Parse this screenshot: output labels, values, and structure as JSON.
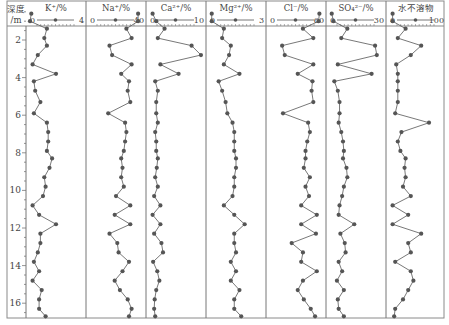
{
  "chart_data": {
    "type": "line",
    "title": "",
    "ylabel": "深度/m",
    "ylabel_lines": [
      "深度",
      "/m"
    ],
    "y_axis": {
      "range": [
        0,
        16.8
      ],
      "ticks": [
        2,
        4,
        6,
        8,
        10,
        12,
        14,
        16
      ],
      "tick_labels": [
        "2",
        "4",
        "6",
        "8",
        "10",
        "12",
        "14",
        "16"
      ],
      "inverted": true
    },
    "depths": [
      0.6,
      1.0,
      1.4,
      1.9,
      2.3,
      2.8,
      3.3,
      3.8,
      4.2,
      4.7,
      5.3,
      5.9,
      6.4,
      6.9,
      7.4,
      7.9,
      8.3,
      8.8,
      9.3,
      9.8,
      10.3,
      10.8,
      11.3,
      11.8,
      12.3,
      12.8,
      13.3,
      13.8,
      14.3,
      14.8,
      15.3,
      15.8,
      16.3,
      16.7
    ],
    "series": [
      {
        "name": "K⁺/%",
        "label_html": "K<tspan baseline-shift='super' font-size='6'>+</tspan>/%",
        "xlim": [
          0,
          4
        ],
        "tick_labels": [
          "0",
          "4"
        ],
        "values": [
          0.1,
          0.0,
          1.3,
          1.1,
          1.3,
          0.6,
          0.2,
          2.0,
          0.3,
          0.4,
          0.8,
          0.3,
          1.3,
          1.4,
          1.4,
          1.3,
          1.7,
          1.5,
          1.1,
          1.2,
          1.0,
          0.2,
          0.7,
          2.0,
          0.8,
          0.8,
          0.6,
          0.3,
          0.7,
          0.2,
          0.9,
          0.7,
          0.7,
          1.2
        ]
      },
      {
        "name": "Na⁺/%",
        "xlim": [
          0,
          40
        ],
        "tick_labels": [
          "0",
          "40"
        ],
        "values": [
          37,
          37,
          28,
          32,
          15,
          17,
          32,
          24,
          30,
          29,
          31,
          14,
          27,
          28,
          27,
          26,
          24,
          25,
          24,
          26,
          20,
          31,
          19,
          31,
          15,
          21,
          22,
          30,
          25,
          19,
          23,
          29,
          32,
          30
        ]
      },
      {
        "name": "Ca²⁺/%",
        "xlim": [
          0,
          10
        ],
        "tick_labels": [
          "0",
          "10"
        ],
        "values": [
          0.5,
          1.2,
          2.8,
          1.5,
          8.0,
          9.8,
          2.0,
          5.5,
          1.0,
          1.5,
          1.2,
          1.2,
          1.5,
          1.0,
          1.2,
          1.2,
          1.5,
          1.3,
          1.0,
          1.5,
          0.8,
          2.0,
          0.5,
          2.0,
          0.8,
          2.2,
          2.5,
          0.6,
          1.4,
          1.8,
          1.2,
          0.9,
          0.8,
          1.0
        ]
      },
      {
        "name": "Mg²⁺/%",
        "xlim": [
          0,
          3
        ],
        "tick_labels": [
          "0",
          "3"
        ],
        "values": [
          0.1,
          0.1,
          0.8,
          0.7,
          1.2,
          1.1,
          0.8,
          1.7,
          0.5,
          0.7,
          0.9,
          1.0,
          1.3,
          1.4,
          1.4,
          1.4,
          1.5,
          1.5,
          1.4,
          1.4,
          1.3,
          0.8,
          1.4,
          2.0,
          1.4,
          1.4,
          1.5,
          1.2,
          1.5,
          1.2,
          1.7,
          1.4,
          1.4,
          1.8
        ]
      },
      {
        "name": "Cl⁻/%",
        "xlim": [
          0,
          60
        ],
        "tick_labels": [
          "0",
          "60"
        ],
        "values": [
          57,
          56,
          38,
          50,
          14,
          17,
          50,
          32,
          49,
          48,
          50,
          15,
          44,
          46,
          43,
          41,
          41,
          39,
          46,
          41,
          45,
          36,
          54,
          36,
          53,
          25,
          38,
          36,
          54,
          38,
          32,
          39,
          47,
          52
        ]
      },
      {
        "name": "SO₄²⁻/%",
        "xlim": [
          0,
          30
        ],
        "tick_labels": [
          "0",
          "30"
        ],
        "values": [
          1.0,
          2.0,
          10.0,
          6.5,
          26.0,
          27.0,
          4.5,
          24.0,
          2.5,
          4.5,
          5.5,
          5.5,
          5.0,
          6.5,
          7.5,
          8.0,
          7.5,
          9.5,
          10.0,
          8.0,
          7.0,
          5.5,
          5.0,
          14.0,
          6.0,
          8.5,
          9.0,
          5.0,
          7.0,
          4.0,
          8.0,
          4.5,
          5.0,
          8.0
        ]
      },
      {
        "name": "水不溶物",
        "xlim": [
          0,
          100
        ],
        "tick_labels": [
          "0",
          "100"
        ],
        "values": [
          5,
          5,
          30,
          15,
          60,
          40,
          12,
          15,
          15,
          15,
          15,
          10,
          75,
          22,
          15,
          20,
          30,
          28,
          30,
          25,
          40,
          5,
          35,
          5,
          60,
          35,
          40,
          10,
          40,
          45,
          35,
          25,
          10,
          8
        ]
      }
    ],
    "grid": false,
    "legend": "none",
    "marker": "filled-circle",
    "colors": {
      "line": "#555555",
      "marker": "#555555",
      "frame": "#777777",
      "text": "#444444"
    }
  }
}
